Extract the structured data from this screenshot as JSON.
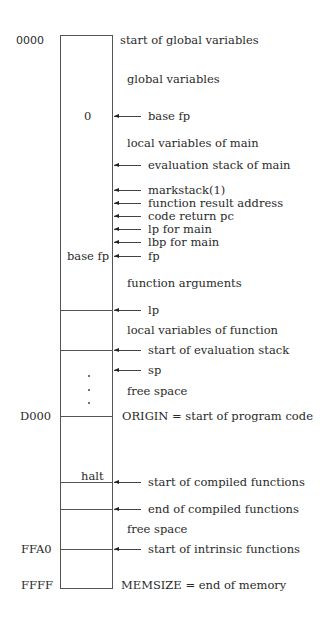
{
  "diagram": {
    "addresses": {
      "start": "0000",
      "origin": "D000",
      "intrinsic": "FFA0",
      "end": "FFFF"
    },
    "in_box": {
      "zero": "0",
      "base_fp": "base fp",
      "halt": "halt"
    },
    "labels": {
      "start_globals": "start of global variables",
      "global_variables": "global variables",
      "base_fp": "base fp",
      "local_vars_main": "local variables of main",
      "eval_stack_main": "evaluation stack of main",
      "markstack": "markstack(1)",
      "function_result": "function result address",
      "code_return": "code return pc",
      "lp_main": "lp for main",
      "lbp_main": "lbp for main",
      "fp": "fp",
      "function_args": "function arguments",
      "lp": "lp",
      "local_vars_function": "local variables of function",
      "start_eval_stack": "start of evaluation stack",
      "sp": "sp",
      "free_space_1": "free space",
      "origin": "ORIGIN = start of program code",
      "start_compiled": "start of compiled functions",
      "end_compiled": "end of compiled functions",
      "free_space_2": "free space",
      "start_intrinsic": "start of intrinsic functions",
      "memsize": "MEMSIZE = end of memory"
    }
  }
}
